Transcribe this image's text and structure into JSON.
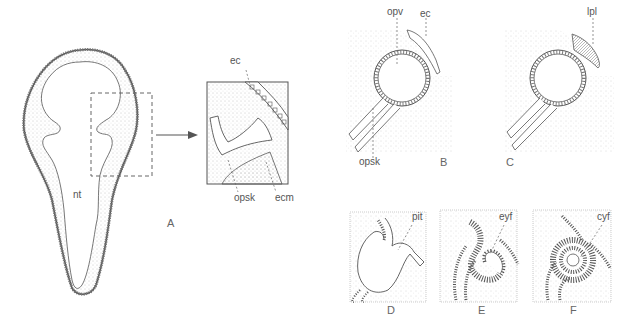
{
  "figure": {
    "panels": [
      {
        "id": "A",
        "label": "A"
      },
      {
        "id": "B",
        "label": "B"
      },
      {
        "id": "C",
        "label": "C"
      },
      {
        "id": "D",
        "label": "D"
      },
      {
        "id": "E",
        "label": "E"
      },
      {
        "id": "F",
        "label": "F"
      }
    ],
    "annotations": {
      "a_nt": "nt",
      "a_ec": "ec",
      "a_opsk": "opsk",
      "a_ecm": "ecm",
      "b_opv": "opv",
      "b_ec": "ec",
      "b_opsk": "opsk",
      "c_lpl": "lpl",
      "d_pit": "pit",
      "e_eyf": "eyf",
      "f_cyf": "cyf"
    },
    "colors": {
      "line": "#555555",
      "stipple": "#8a8a8a",
      "background": "#ffffff"
    }
  }
}
